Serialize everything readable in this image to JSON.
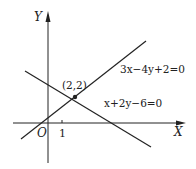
{
  "diagram": {
    "axes": {
      "x_label": "X",
      "y_label": "Y",
      "origin_label": "O",
      "x_tick_label": "1"
    },
    "lines": [
      {
        "equation": "3x−4y+2=0",
        "color": "#222222"
      },
      {
        "equation": "x+2y−6=0",
        "color": "#222222"
      }
    ],
    "intersection": {
      "label": "(2,2)",
      "x": 2,
      "y": 2
    },
    "colors": {
      "stroke": "#222222",
      "background": "#ffffff"
    }
  }
}
